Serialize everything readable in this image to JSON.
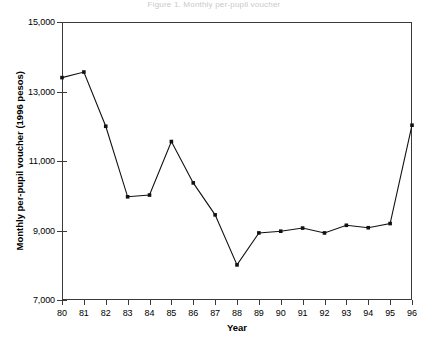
{
  "figure": {
    "cut_caption": "Figure 1. Monthly per-pupil voucher",
    "background_color": "#ffffff",
    "line_color": "#111111",
    "axis_color": "#3a3a3a"
  },
  "axes": {
    "xlabel": "Year",
    "ylabel": "Monthly per-pupil voucher (1996 pesos)",
    "y_ticks": [
      "7,000",
      "9,000",
      "11,000",
      "13,000",
      "15,000"
    ],
    "x_ticks": [
      "80",
      "81",
      "82",
      "83",
      "84",
      "85",
      "86",
      "87",
      "88",
      "89",
      "90",
      "91",
      "92",
      "93",
      "94",
      "95",
      "96"
    ]
  },
  "chart_data": {
    "type": "line",
    "title": "",
    "xlabel": "Year",
    "ylabel": "Monthly per-pupil voucher (1996 pesos)",
    "xlim": [
      80,
      96
    ],
    "ylim": [
      7000,
      15000
    ],
    "y_tick_values": [
      7000,
      9000,
      11000,
      13000,
      15000
    ],
    "x_tick_values": [
      80,
      81,
      82,
      83,
      84,
      85,
      86,
      87,
      88,
      89,
      90,
      91,
      92,
      93,
      94,
      95,
      96
    ],
    "grid": false,
    "legend": false,
    "marker": "square",
    "x": [
      80,
      81,
      82,
      83,
      84,
      85,
      86,
      87,
      88,
      89,
      90,
      91,
      92,
      93,
      94,
      95,
      96
    ],
    "values": [
      13400,
      13560,
      12000,
      9970,
      10020,
      11560,
      10370,
      9450,
      8010,
      8930,
      8980,
      9070,
      8930,
      9150,
      9080,
      9200,
      12030
    ],
    "categories": [
      "80",
      "81",
      "82",
      "83",
      "84",
      "85",
      "86",
      "87",
      "88",
      "89",
      "90",
      "91",
      "92",
      "93",
      "94",
      "95",
      "96"
    ]
  }
}
